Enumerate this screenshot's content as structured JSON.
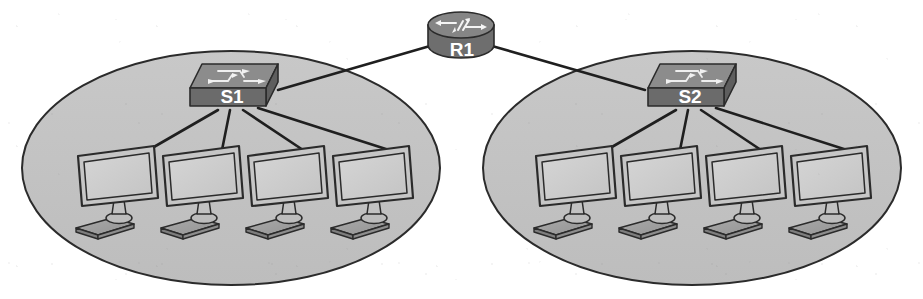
{
  "diagram": {
    "background_color": "#ffffff",
    "cloud_fill": "#c3c3c3",
    "cloud_stroke": "#2b2b2b",
    "link_color": "#1f1f1f",
    "device_body_color": "#6f6f6f",
    "device_dark_color": "#565656",
    "device_top_color": "#8a8a8a",
    "label_color": "#ffffff",
    "screen_fill": "#cdcdcd",
    "outline_color": "#2b2b2b"
  },
  "router": {
    "name": "R1",
    "label": "R1",
    "type": "router",
    "icon": "router-cylinder-icon",
    "cx": 460,
    "cy": 38
  },
  "lans": [
    {
      "id": "lan-left",
      "switch": {
        "name": "S1",
        "label": "S1",
        "type": "switch",
        "icon": "switch-box-icon",
        "cx": 232,
        "cy": 88
      },
      "hosts": [
        {
          "label": "",
          "name": "pc-1",
          "icon": "desktop-pc-icon",
          "cx": 118,
          "cy": 190
        },
        {
          "label": "",
          "name": "pc-2",
          "icon": "desktop-pc-icon",
          "cx": 203,
          "cy": 190
        },
        {
          "label": "",
          "name": "pc-3",
          "icon": "desktop-pc-icon",
          "cx": 288,
          "cy": 190
        },
        {
          "label": "",
          "name": "pc-4",
          "icon": "desktop-pc-icon",
          "cx": 373,
          "cy": 190
        }
      ]
    },
    {
      "id": "lan-right",
      "switch": {
        "name": "S2",
        "label": "S2",
        "type": "switch",
        "icon": "switch-box-icon",
        "cx": 690,
        "cy": 88
      },
      "hosts": [
        {
          "label": "",
          "name": "pc-5",
          "icon": "desktop-pc-icon",
          "cx": 576,
          "cy": 190
        },
        {
          "label": "",
          "name": "pc-6",
          "icon": "desktop-pc-icon",
          "cx": 661,
          "cy": 190
        },
        {
          "label": "",
          "name": "pc-7",
          "icon": "desktop-pc-icon",
          "cx": 746,
          "cy": 190
        },
        {
          "label": "",
          "name": "pc-8",
          "icon": "desktop-pc-icon",
          "cx": 831,
          "cy": 190
        }
      ]
    }
  ],
  "links": [
    {
      "name": "link-r1-s1",
      "from": "R1",
      "to": "S1"
    },
    {
      "name": "link-r1-s2",
      "from": "R1",
      "to": "S2"
    },
    {
      "name": "link-s1-pc1",
      "from": "S1",
      "to": "pc-1"
    },
    {
      "name": "link-s1-pc2",
      "from": "S1",
      "to": "pc-2"
    },
    {
      "name": "link-s1-pc3",
      "from": "S1",
      "to": "pc-3"
    },
    {
      "name": "link-s1-pc4",
      "from": "S1",
      "to": "pc-4"
    },
    {
      "name": "link-s2-pc5",
      "from": "S2",
      "to": "pc-5"
    },
    {
      "name": "link-s2-pc6",
      "from": "S2",
      "to": "pc-6"
    },
    {
      "name": "link-s2-pc7",
      "from": "S2",
      "to": "pc-7"
    },
    {
      "name": "link-s2-pc8",
      "from": "S2",
      "to": "pc-8"
    }
  ]
}
